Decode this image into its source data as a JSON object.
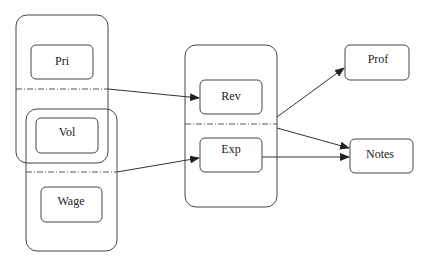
{
  "diagram": {
    "groups": [
      {
        "id": "group-pri-vol"
      },
      {
        "id": "group-vol-wage"
      },
      {
        "id": "group-rev-exp"
      }
    ],
    "nodes": [
      {
        "id": "pri",
        "label": "Pri"
      },
      {
        "id": "vol",
        "label": "Vol"
      },
      {
        "id": "wage",
        "label": "Wage"
      },
      {
        "id": "rev",
        "label": "Rev"
      },
      {
        "id": "exp",
        "label": "Exp"
      },
      {
        "id": "prof",
        "label": "Prof"
      },
      {
        "id": "notes",
        "label": "Notes"
      }
    ],
    "edges": [
      {
        "from": "group-pri-vol",
        "to": "rev"
      },
      {
        "from": "group-vol-wage",
        "to": "exp"
      },
      {
        "from": "group-rev-exp",
        "to": "prof"
      },
      {
        "from": "group-rev-exp",
        "to": "notes"
      },
      {
        "from": "exp",
        "to": "notes"
      }
    ],
    "colors": {
      "stroke": "#333333",
      "background": "#ffffff"
    }
  }
}
